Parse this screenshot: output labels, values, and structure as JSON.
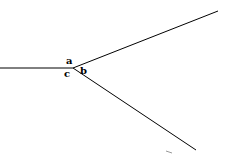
{
  "diagram": {
    "type": "angle-rays",
    "vertex": {
      "x": 73,
      "y": 68
    },
    "lines": [
      {
        "name": "horizontal-ray",
        "x1": 0,
        "y1": 68,
        "x2": 73,
        "y2": 68
      },
      {
        "name": "upper-ray",
        "x1": 73,
        "y1": 68,
        "x2": 218,
        "y2": 11
      },
      {
        "name": "lower-ray",
        "x1": 73,
        "y1": 68,
        "x2": 196,
        "y2": 150
      }
    ],
    "labels": [
      {
        "name": "angle-label-a",
        "text": "a",
        "x": 66,
        "y": 64
      },
      {
        "name": "angle-label-b",
        "text": "b",
        "x": 80,
        "y": 74
      },
      {
        "name": "angle-label-c",
        "text": "c",
        "x": 64,
        "y": 77
      }
    ],
    "stroke_color": "#000000"
  }
}
